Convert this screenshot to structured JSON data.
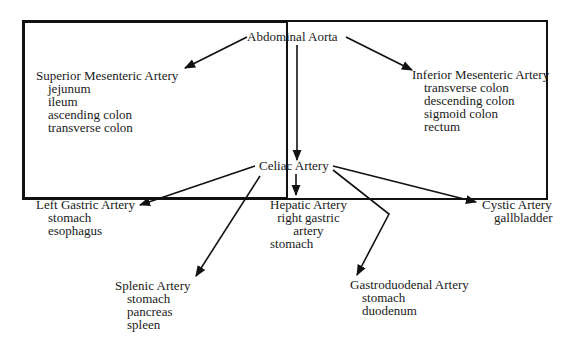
{
  "diagram": {
    "root": "Abdominal Aorta",
    "nodes": {
      "superior_mesenteric": {
        "title": "Superior Mesenteric Artery",
        "items": [
          "jejunum",
          "ileum",
          "ascending colon",
          "transverse colon"
        ]
      },
      "inferior_mesenteric": {
        "title": "Inferior Mesenteric Artery",
        "items": [
          "transverse colon",
          "descending colon",
          "sigmoid colon",
          "rectum"
        ]
      },
      "celiac": {
        "title": "Celiac Artery"
      },
      "left_gastric": {
        "title": "Left Gastric Artery",
        "items": [
          "stomach",
          "esophagus"
        ]
      },
      "hepatic": {
        "title": "Hepatic Artery",
        "items": [
          "right gastric",
          "artery",
          "stomach"
        ]
      },
      "cystic": {
        "title": "Cystic Artery",
        "items": [
          "gallbladder"
        ]
      },
      "splenic": {
        "title": "Splenic Artery",
        "items": [
          "stomach",
          "pancreas",
          "spleen"
        ]
      },
      "gastroduodenal": {
        "title": "Gastroduodenal Artery",
        "items": [
          "stomach",
          "duodenum"
        ]
      }
    },
    "edges": [
      [
        "Abdominal Aorta",
        "Superior Mesenteric Artery"
      ],
      [
        "Abdominal Aorta",
        "Inferior Mesenteric Artery"
      ],
      [
        "Abdominal Aorta",
        "Celiac Artery"
      ],
      [
        "Celiac Artery",
        "Left Gastric Artery"
      ],
      [
        "Celiac Artery",
        "Splenic Artery"
      ],
      [
        "Celiac Artery",
        "Hepatic Artery"
      ],
      [
        "Celiac Artery",
        "Gastroduodenal Artery"
      ],
      [
        "Celiac Artery",
        "Cystic Artery"
      ]
    ]
  }
}
